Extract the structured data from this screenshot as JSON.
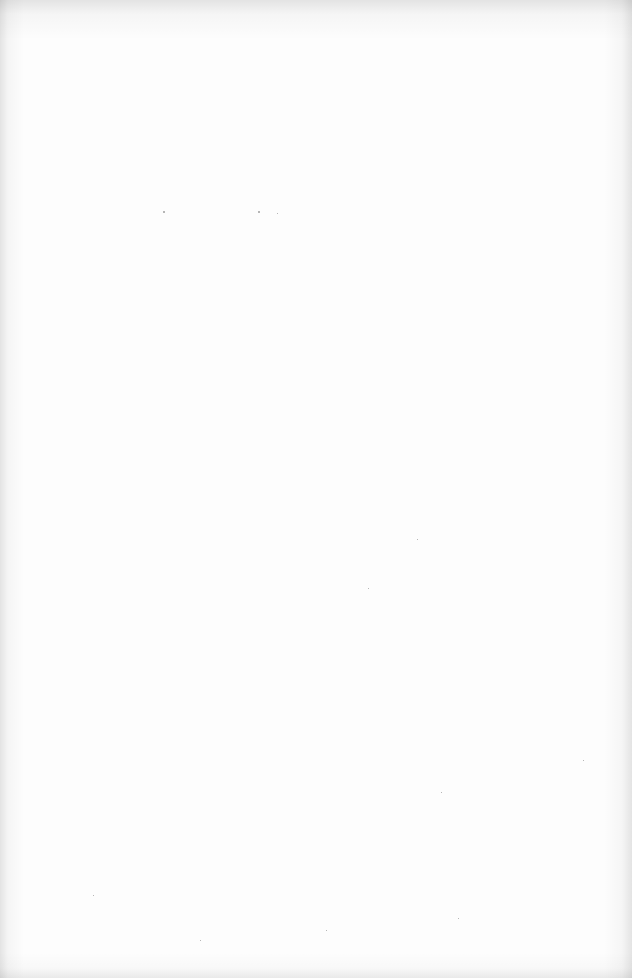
{
  "document": {
    "type": "scanned-page",
    "content": "blank",
    "text_blocks": []
  }
}
